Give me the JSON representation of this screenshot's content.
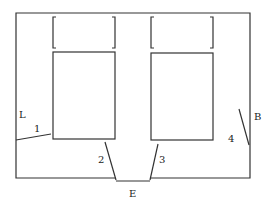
{
  "diagram": {
    "type": "floor-plan",
    "labels": {
      "L": "L",
      "B": "B",
      "E": "E",
      "door1": "1",
      "door2": "2",
      "door3": "3",
      "door4": "4"
    },
    "colors": {
      "line": "#333333",
      "background": "#ffffff",
      "text": "#222222"
    }
  }
}
